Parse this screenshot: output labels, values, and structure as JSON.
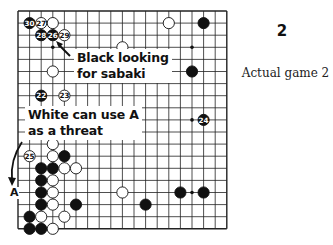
{
  "figure": {
    "number": "2",
    "caption": "Actual game 2"
  },
  "board": {
    "size": 19,
    "origin_px": [
      18,
      11
    ],
    "spacing_px": [
      11.6,
      12.1
    ],
    "star_points": [
      [
        3,
        3
      ],
      [
        9,
        3
      ],
      [
        15,
        3
      ],
      [
        3,
        9
      ],
      [
        9,
        9
      ],
      [
        15,
        9
      ],
      [
        3,
        15
      ],
      [
        9,
        15
      ],
      [
        15,
        15
      ]
    ],
    "stones": [
      {
        "color": "black",
        "col": 1,
        "row": 1,
        "label": "30"
      },
      {
        "color": "white",
        "col": 2,
        "row": 1,
        "label": "27"
      },
      {
        "color": "white",
        "col": 3,
        "row": 1,
        "label": ""
      },
      {
        "color": "black",
        "col": 2,
        "row": 2,
        "label": "28"
      },
      {
        "color": "black",
        "col": 3,
        "row": 2,
        "label": "26"
      },
      {
        "color": "white",
        "col": 4,
        "row": 2,
        "label": "29"
      },
      {
        "color": "white",
        "col": 3,
        "row": 5,
        "label": ""
      },
      {
        "color": "black",
        "col": 2,
        "row": 7,
        "label": "22"
      },
      {
        "color": "white",
        "col": 4,
        "row": 7,
        "label": "23"
      },
      {
        "color": "white",
        "col": 9,
        "row": 3,
        "label": ""
      },
      {
        "color": "white",
        "col": 13,
        "row": 1,
        "label": ""
      },
      {
        "color": "black",
        "col": 16,
        "row": 1,
        "label": ""
      },
      {
        "color": "black",
        "col": 15,
        "row": 5,
        "label": ""
      },
      {
        "color": "black",
        "col": 16,
        "row": 9,
        "label": "24"
      },
      {
        "color": "white",
        "col": 3,
        "row": 11,
        "label": ""
      },
      {
        "color": "white",
        "col": 1,
        "row": 12,
        "label": "25"
      },
      {
        "color": "white",
        "col": 3,
        "row": 12,
        "label": ""
      },
      {
        "color": "black",
        "col": 4,
        "row": 12,
        "label": ""
      },
      {
        "color": "black",
        "col": 2,
        "row": 13,
        "label": ""
      },
      {
        "color": "black",
        "col": 3,
        "row": 13,
        "label": ""
      },
      {
        "color": "white",
        "col": 4,
        "row": 13,
        "label": ""
      },
      {
        "color": "white",
        "col": 5,
        "row": 13,
        "label": ""
      },
      {
        "color": "black",
        "col": 2,
        "row": 14,
        "label": ""
      },
      {
        "color": "white",
        "col": 3,
        "row": 14,
        "label": ""
      },
      {
        "color": "black",
        "col": 2,
        "row": 15,
        "label": ""
      },
      {
        "color": "white",
        "col": 3,
        "row": 15,
        "label": ""
      },
      {
        "color": "black",
        "col": 2,
        "row": 16,
        "label": ""
      },
      {
        "color": "white",
        "col": 3,
        "row": 16,
        "label": ""
      },
      {
        "color": "black",
        "col": 5,
        "row": 16,
        "label": ""
      },
      {
        "color": "black",
        "col": 1,
        "row": 17,
        "label": ""
      },
      {
        "color": "white",
        "col": 2,
        "row": 17,
        "label": ""
      },
      {
        "color": "white",
        "col": 4,
        "row": 17,
        "label": ""
      },
      {
        "color": "black",
        "col": 1,
        "row": 18,
        "label": ""
      },
      {
        "color": "black",
        "col": 2,
        "row": 18,
        "label": ""
      },
      {
        "color": "white",
        "col": 3,
        "row": 18,
        "label": ""
      },
      {
        "color": "white",
        "col": 9,
        "row": 15,
        "label": ""
      },
      {
        "color": "black",
        "col": 11,
        "row": 16,
        "label": ""
      },
      {
        "color": "black",
        "col": 14,
        "row": 15,
        "label": ""
      },
      {
        "color": "black",
        "col": 16,
        "row": 15,
        "label": ""
      }
    ]
  },
  "annotations": {
    "sabaki_line1": "Black looking",
    "sabaki_line2": "for sabaki",
    "threat_line1": "White can use A",
    "threat_line2": "as a threat",
    "point_a": "A"
  }
}
